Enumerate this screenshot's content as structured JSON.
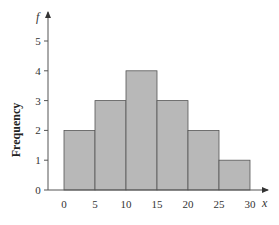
{
  "chart_data": {
    "type": "bar",
    "subtype": "histogram",
    "title": "",
    "xlabel": "x",
    "ylabel": "Frequency",
    "y_axis_symbol": "f",
    "bins": [
      [
        0,
        5
      ],
      [
        5,
        10
      ],
      [
        10,
        15
      ],
      [
        15,
        20
      ],
      [
        20,
        25
      ],
      [
        25,
        30
      ]
    ],
    "categories": [
      "0-5",
      "5-10",
      "10-15",
      "15-20",
      "20-25",
      "25-30"
    ],
    "values": [
      2,
      3,
      4,
      3,
      2,
      1
    ],
    "x_ticks": [
      "0",
      "5",
      "10",
      "15",
      "20",
      "25",
      "30"
    ],
    "y_ticks": [
      "0",
      "1",
      "2",
      "3",
      "4",
      "5"
    ],
    "xlim": [
      0,
      30
    ],
    "ylim": [
      0,
      5.5
    ],
    "grid": false,
    "legend": null,
    "bar_color": "#b8b8b8",
    "edge_color": "#555555"
  }
}
